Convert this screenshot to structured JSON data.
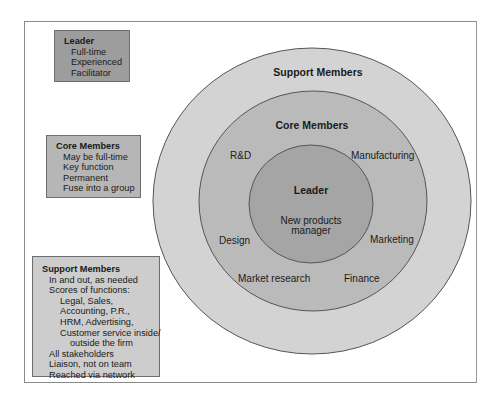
{
  "diagram": {
    "type": "concentric-team-structure",
    "rings": {
      "outer": {
        "title": "Support Members",
        "fill": "#d3d3d3"
      },
      "middle": {
        "title": "Core Members",
        "fill": "#bababa",
        "functions": [
          "R&D",
          "Manufacturing",
          "Design",
          "Marketing",
          "Market research",
          "Finance"
        ]
      },
      "inner": {
        "title": "Leader",
        "subtitle_line1": "New products",
        "subtitle_line2": "manager",
        "fill": "#a5a5a5"
      }
    }
  },
  "legend_boxes": {
    "leader": {
      "title": "Leader",
      "items": [
        "Full-time",
        "Experienced",
        "Facilitator"
      ],
      "fill": "#9d9d9d"
    },
    "core": {
      "title": "Core Members",
      "items": [
        "May be full-time",
        "Key function",
        "Permanent",
        "Fuse into a group"
      ],
      "fill": "#b6b6b6"
    },
    "support": {
      "title": "Support Members",
      "items": [
        "In and out, as needed",
        "Scores of functions:",
        "Legal, Sales,",
        "Accounting, P.R.,",
        "HRM, Advertising,",
        "Customer service inside/",
        "outside the firm",
        "All stakeholders",
        "Liaison, not on team",
        "Reached via network"
      ],
      "fill": "#cdcdcd"
    }
  }
}
